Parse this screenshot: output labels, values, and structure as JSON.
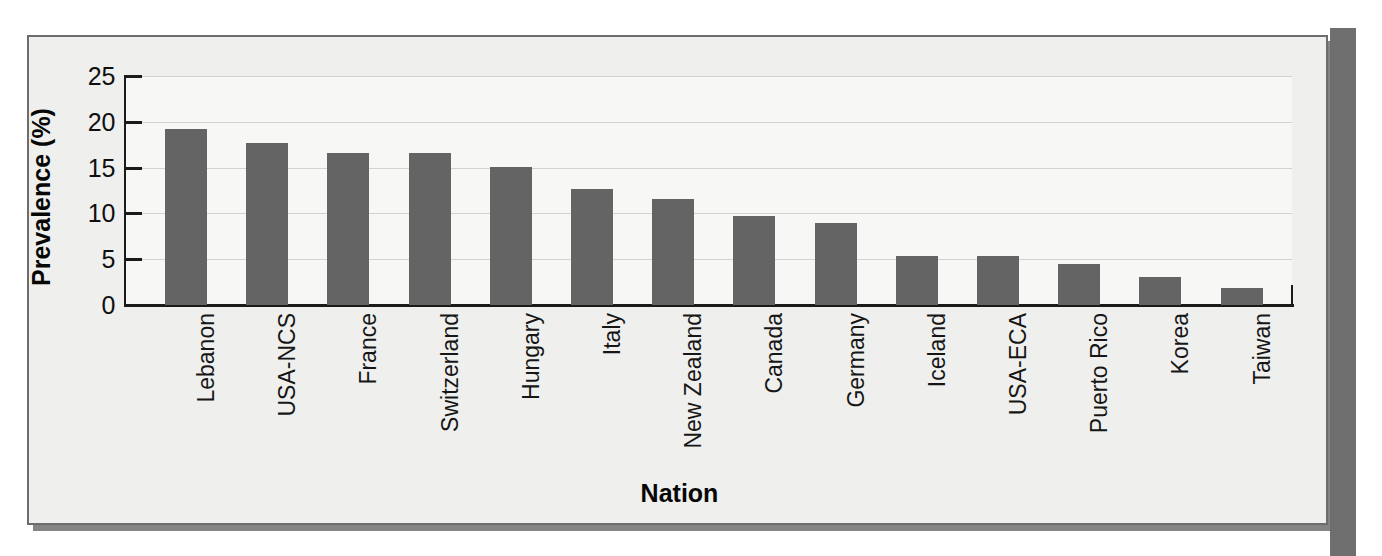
{
  "chart_data": {
    "type": "bar",
    "title": "",
    "xlabel": "Nation",
    "ylabel": "Prevalence (%)",
    "ylim": [
      0,
      25
    ],
    "yticks": [
      0,
      5,
      10,
      15,
      20,
      25
    ],
    "ytick_labels": [
      "0",
      "5",
      "10",
      "15",
      "20",
      "25"
    ],
    "grid": true,
    "legend": "none",
    "bar_color": "#646464",
    "plot_background": "#f7f7f5",
    "frame_background": "#efefed",
    "categories": [
      "Lebanon",
      "USA-NCS",
      "France",
      "Switzerland",
      "Hungary",
      "Italy",
      "New Zealand",
      "Canada",
      "Germany",
      "Iceland",
      "USA-ECA",
      "Puerto Rico",
      "Korea",
      "Taiwan"
    ],
    "values": [
      19.2,
      17.7,
      16.6,
      16.6,
      15.1,
      12.7,
      11.6,
      9.7,
      8.9,
      5.4,
      5.4,
      4.5,
      3.1,
      1.9
    ]
  }
}
